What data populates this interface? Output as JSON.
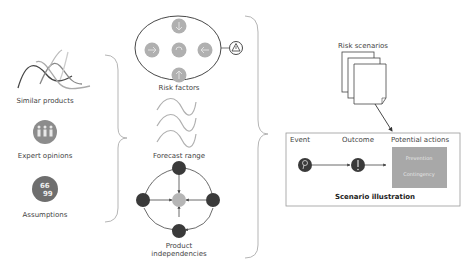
{
  "inputs": {
    "similar_products": "Similar products",
    "expert_opinions": "Expert opinions",
    "assumptions": "Assumptions",
    "quote_glyph": "66\n99"
  },
  "factors": {
    "risk_factors": "Risk factors",
    "forecast_range": "Forecast range",
    "product_independencies_line1": "Product",
    "product_independencies_line2": "independencies"
  },
  "scenarios": {
    "risk_scenarios": "Risk scenarios",
    "event": "Event",
    "outcome": "Outcome",
    "potential_actions": "Potential actions",
    "prevention": "Prevention",
    "contingency": "Contingency",
    "scenario_illustration": "Scenario illustration"
  },
  "colors": {
    "dark_node": "#3a3a3a",
    "mid_gray": "#8c8c8c",
    "light_gray": "#b0b0b0",
    "brace": "#b5b5b5",
    "action_box": "#a8a8a8"
  }
}
